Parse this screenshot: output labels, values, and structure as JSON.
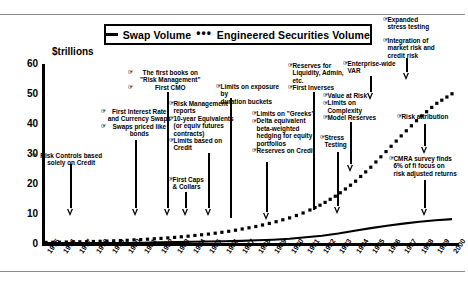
{
  "chart_data": {
    "type": "line",
    "title": "",
    "xlabel": "",
    "ylabel": "$trillions",
    "ylim": [
      0,
      60
    ],
    "yticks": [
      0,
      10,
      20,
      30,
      40,
      50,
      60
    ],
    "grid": false,
    "legend_position": "top-center",
    "categories": [
      "1975",
      "1976",
      "1977",
      "1978",
      "1979",
      "1980",
      "1981",
      "1982",
      "1983",
      "1984",
      "1985",
      "1986",
      "1987",
      "1988",
      "1989",
      "1990",
      "1991",
      "1992",
      "1993",
      "1994",
      "1995",
      "1996",
      "1997",
      "1998",
      "1999",
      "2000"
    ],
    "series": [
      {
        "name": "Swap Volume",
        "style": "solid",
        "values": [
          0,
          0,
          0,
          0,
          0,
          0,
          0.1,
          0.2,
          0.3,
          0.4,
          0.5,
          0.6,
          0.7,
          0.9,
          1.1,
          1.4,
          1.9,
          2.4,
          3.2,
          4.1,
          5.0,
          5.8,
          6.5,
          7.1,
          7.6,
          8.0
        ]
      },
      {
        "name": "Engineered Securities Volume",
        "style": "dotted",
        "values": [
          0.2,
          0.3,
          0.4,
          0.5,
          0.7,
          0.9,
          1.2,
          1.5,
          1.9,
          2.4,
          3.0,
          3.7,
          4.6,
          5.6,
          6.9,
          8.4,
          10.4,
          13.0,
          16.3,
          20.4,
          25.4,
          31.0,
          36.6,
          42.0,
          46.6,
          50.0
        ]
      }
    ]
  },
  "legend": {
    "solid_marker": "—",
    "solid_label": "Swap Volume",
    "dotted_marker": "•••",
    "dotted_label": "Engineered Securities Volume"
  },
  "axis": {
    "y_title": "$trillions",
    "y_ticks": [
      "60",
      "50",
      "40",
      "30",
      "20",
      "10",
      "0"
    ],
    "x_ticks": [
      "1975",
      "1976",
      "1977",
      "1978",
      "1979",
      "1980",
      "1981",
      "1982",
      "1983",
      "1984",
      "1985",
      "1986",
      "1987",
      "1988",
      "1989",
      "1990",
      "1991",
      "1992",
      "1993",
      "1994",
      "1995",
      "1996",
      "1997",
      "1998",
      "1999",
      "2000"
    ]
  },
  "annotations": [
    {
      "id": "risk-controls-credit",
      "lines": [
        "Risk Controls based",
        "solely on Credit"
      ],
      "bulleted": [
        true,
        false
      ]
    },
    {
      "id": "first-swaps",
      "lines": [
        "First Interest Rate",
        "and Currency Swaps",
        "Swaps priced like",
        "bonds"
      ],
      "bulleted": [
        true,
        false,
        true,
        false
      ]
    },
    {
      "id": "first-books-risk-management",
      "lines": [
        "The first books on",
        "\"Risk Management\"",
        "First CMO"
      ],
      "bulleted": [
        true,
        false,
        true
      ]
    },
    {
      "id": "risk-management-reports",
      "lines": [
        "Risk Management",
        "reports",
        "10-year Equivalents",
        "(or equiv futures",
        "contracts)",
        "Limits based on",
        "Credit"
      ],
      "bulleted": [
        true,
        false,
        true,
        false,
        false,
        true,
        false
      ]
    },
    {
      "id": "first-caps-collars",
      "lines": [
        "First Caps",
        "& Collars"
      ],
      "bulleted": [
        true,
        false
      ]
    },
    {
      "id": "limits-exposure-duration",
      "lines": [
        "Limits on exposure by",
        "duration buckets"
      ],
      "bulleted": [
        true,
        false
      ]
    },
    {
      "id": "limits-on-greeks",
      "lines": [
        "Limits on \"Greeks\"",
        "Delta equivalent",
        "beta-weighted",
        "hedging for equity",
        "portfolios",
        "Reserves on Credit"
      ],
      "bulleted": [
        true,
        true,
        false,
        false,
        false,
        true
      ]
    },
    {
      "id": "reserves-liquidity",
      "lines": [
        "Reserves for",
        "Liquidity, Admin,",
        "etc.",
        "First Inverses"
      ],
      "bulleted": [
        true,
        false,
        false,
        true
      ]
    },
    {
      "id": "value-at-risk",
      "lines": [
        "Value at Risk",
        "Limits on",
        "Complexity",
        "Model Reserves"
      ],
      "bulleted": [
        true,
        true,
        false,
        true
      ]
    },
    {
      "id": "stress-testing",
      "lines": [
        "Stress",
        "Testing"
      ],
      "bulleted": [
        true,
        false
      ]
    },
    {
      "id": "enterprise-wide-var",
      "lines": [
        "Enterprise-wide",
        "VAR"
      ],
      "bulleted": [
        true,
        false
      ]
    },
    {
      "id": "expanded-stress-testing",
      "lines": [
        "Expanded",
        "stress testing"
      ],
      "bulleted": [
        true,
        false
      ]
    },
    {
      "id": "integration-market-credit-risk",
      "lines": [
        "Integration of",
        "market risk and",
        "credit risk"
      ],
      "bulleted": [
        true,
        false,
        false
      ]
    },
    {
      "id": "risk-attribution",
      "lines": [
        "Risk attribution"
      ],
      "bulleted": [
        true
      ]
    },
    {
      "id": "cmra-survey",
      "lines": [
        "CMRA survey finds",
        "6% of fi focus on",
        "risk adjusted returns"
      ],
      "bulleted": [
        true,
        false,
        false
      ]
    }
  ]
}
